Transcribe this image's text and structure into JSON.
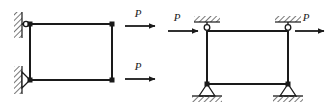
{
  "figure": {
    "name": "structural-frame-comparison-diagram",
    "background_color": "#ffffff",
    "line_color": "#1a1a1a",
    "hatch_color": "#4d4d4d",
    "width": 329,
    "height": 107
  },
  "frames": [
    {
      "id": "left-frame",
      "description": "Rectangular frame fixed to a vertical wall at left, loaded by two horizontal forces P at the free right corners",
      "nodes": [
        {
          "name": "top-left-node",
          "x": 30,
          "y": 24
        },
        {
          "name": "top-right-node",
          "x": 112,
          "y": 24
        },
        {
          "name": "bottom-left-node",
          "x": 30,
          "y": 80
        },
        {
          "name": "bottom-right-node",
          "x": 112,
          "y": 80
        }
      ],
      "members": [
        {
          "name": "top-beam",
          "from": "top-left-node",
          "to": "top-right-node"
        },
        {
          "name": "bottom-beam",
          "from": "bottom-left-node",
          "to": "bottom-right-node"
        },
        {
          "name": "left-column",
          "from": "top-left-node",
          "to": "bottom-left-node"
        },
        {
          "name": "right-column",
          "from": "top-right-node",
          "to": "bottom-right-node"
        }
      ],
      "supports": [
        {
          "name": "top-left-roller-support",
          "type": "roller-on-wall",
          "x": 22,
          "y": 24
        },
        {
          "name": "bottom-left-pin-support",
          "type": "pin-on-wall",
          "x": 22,
          "y": 80
        }
      ],
      "walls": [
        {
          "name": "upper-wall-hatch",
          "x": 14,
          "y": 12,
          "width": 8,
          "height": 26,
          "orientation": "vertical"
        },
        {
          "name": "lower-wall-hatch",
          "x": 14,
          "y": 66,
          "width": 8,
          "height": 28,
          "orientation": "vertical"
        }
      ],
      "loads": [
        {
          "name": "top-load-arrow",
          "label": "P",
          "direction": "right",
          "x_start": 125,
          "x_end": 158,
          "y": 26,
          "label_x": 138,
          "label_y": 16
        },
        {
          "name": "bottom-load-arrow",
          "label": "P",
          "direction": "right",
          "x_start": 125,
          "x_end": 158,
          "y": 79,
          "label_x": 138,
          "label_y": 69
        }
      ]
    },
    {
      "id": "right-frame",
      "description": "Rectangular frame pinned to the ceiling at both top corners and pinned to the ground at both bottom corners, loaded by two horizontal forces P at the top corners",
      "nodes": [
        {
          "name": "top-left-node",
          "x": 207,
          "y": 30
        },
        {
          "name": "top-right-node",
          "x": 288,
          "y": 30
        },
        {
          "name": "bottom-left-node",
          "x": 207,
          "y": 84
        },
        {
          "name": "bottom-right-node",
          "x": 288,
          "y": 84
        }
      ],
      "members": [
        {
          "name": "top-beam",
          "from": "top-left-node",
          "to": "top-right-node"
        },
        {
          "name": "bottom-beam",
          "from": "bottom-left-node",
          "to": "bottom-right-node"
        },
        {
          "name": "left-column",
          "from": "top-left-node",
          "to": "bottom-left-node"
        },
        {
          "name": "right-column",
          "from": "top-right-node",
          "to": "bottom-right-node"
        }
      ],
      "supports": [
        {
          "name": "top-left-pin-support",
          "type": "pin-on-ceiling",
          "x": 207,
          "y": 24
        },
        {
          "name": "top-right-pin-support",
          "type": "pin-on-ceiling",
          "x": 288,
          "y": 24
        },
        {
          "name": "bottom-left-pin-support",
          "type": "pin-on-ground",
          "x": 207,
          "y": 84
        },
        {
          "name": "bottom-right-pin-support",
          "type": "pin-on-ground",
          "x": 288,
          "y": 84
        }
      ],
      "walls": [
        {
          "name": "top-left-ceiling-hatch",
          "x": 194,
          "y": 16,
          "width": 26,
          "height": 6,
          "orientation": "horizontal"
        },
        {
          "name": "top-right-ceiling-hatch",
          "x": 275,
          "y": 16,
          "width": 26,
          "height": 6,
          "orientation": "horizontal"
        },
        {
          "name": "bottom-left-ground-hatch",
          "x": 192,
          "y": 96,
          "width": 30,
          "height": 6,
          "orientation": "horizontal"
        },
        {
          "name": "bottom-right-ground-hatch",
          "x": 273,
          "y": 96,
          "width": 30,
          "height": 6,
          "orientation": "horizontal"
        }
      ],
      "loads": [
        {
          "name": "top-left-load-arrow",
          "label": "P",
          "direction": "right",
          "x_start": 168,
          "x_end": 200,
          "y": 30,
          "label_x": 176,
          "label_y": 20
        },
        {
          "name": "top-right-load-arrow",
          "label": "P",
          "direction": "right",
          "x_start": 295,
          "x_end": 325,
          "y": 30,
          "label_x": 305,
          "label_y": 20
        }
      ]
    }
  ]
}
